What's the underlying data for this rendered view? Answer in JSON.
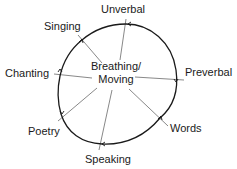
{
  "diagram": {
    "center": {
      "line1": "Breathing/",
      "line2": "Moving"
    },
    "nodes": [
      {
        "id": "unverbal",
        "label": "Unverbal"
      },
      {
        "id": "preverbal",
        "label": "Preverbal"
      },
      {
        "id": "words",
        "label": "Words"
      },
      {
        "id": "speaking",
        "label": "Speaking"
      },
      {
        "id": "poetry",
        "label": "Poetry"
      },
      {
        "id": "chanting",
        "label": "Chanting"
      },
      {
        "id": "singing",
        "label": "Singing"
      }
    ],
    "colors": {
      "loop": "#1a1a1a",
      "spoke": "#6a6a6a",
      "text": "#1a1a1a"
    }
  }
}
